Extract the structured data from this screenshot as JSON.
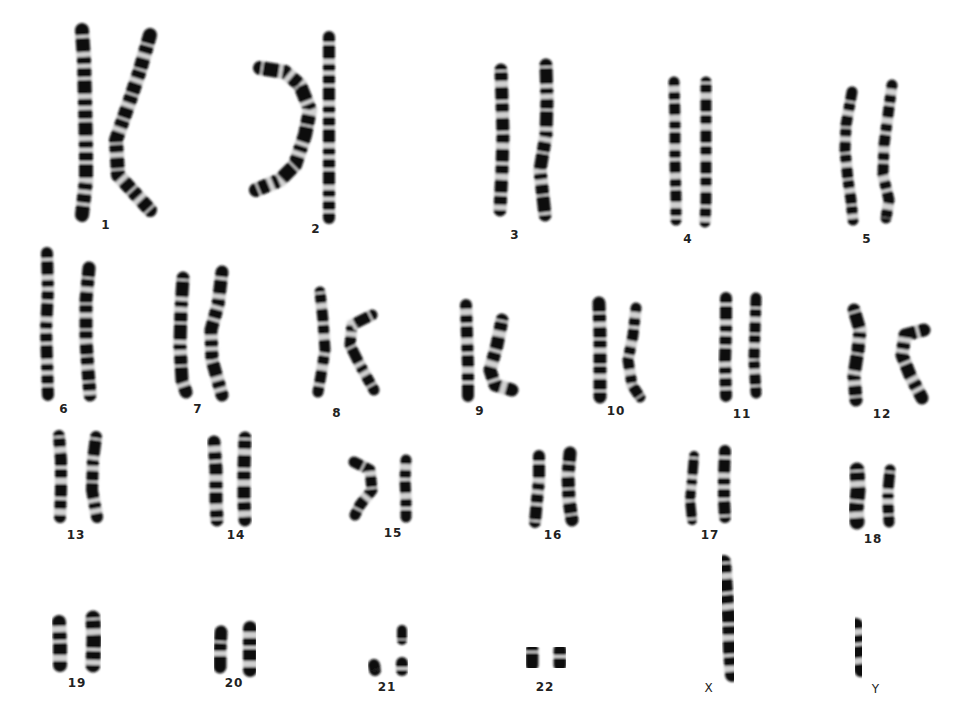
{
  "background": "#ffffff",
  "ink": "#111111",
  "groups": [
    {
      "label": "1",
      "x": 106,
      "ly": 228,
      "chroms": [
        {
          "pts": [
            [
              82,
              30
            ],
            [
              84,
              60
            ],
            [
              85,
              100
            ],
            [
              86,
              150
            ],
            [
              86,
              180
            ],
            [
              82,
              215
            ]
          ],
          "w": 14
        },
        {
          "pts": [
            [
              150,
              35
            ],
            [
              140,
              70
            ],
            [
              130,
              100
            ],
            [
              116,
              140
            ],
            [
              118,
              175
            ],
            [
              150,
              210
            ]
          ],
          "w": 14
        }
      ]
    },
    {
      "label": "2",
      "x": 316,
      "ly": 232,
      "chroms": [
        {
          "pts": [
            [
              260,
              68
            ],
            [
              285,
              72
            ],
            [
              300,
              85
            ],
            [
              310,
              110
            ],
            [
              305,
              135
            ],
            [
              295,
              165
            ],
            [
              280,
              180
            ],
            [
              256,
              190
            ]
          ],
          "w": 14
        },
        {
          "pts": [
            [
              329,
              37
            ],
            [
              329,
              70
            ],
            [
              329,
              100
            ],
            [
              329,
              130
            ],
            [
              329,
              160
            ],
            [
              329,
              190
            ],
            [
              329,
              218
            ]
          ],
          "w": 12
        }
      ]
    },
    {
      "label": "3",
      "x": 515,
      "ly": 238,
      "chroms": [
        {
          "pts": [
            [
              501,
              70
            ],
            [
              502,
              100
            ],
            [
              503,
              135
            ],
            [
              502,
              170
            ],
            [
              500,
              210
            ]
          ],
          "w": 13
        },
        {
          "pts": [
            [
              546,
              65
            ],
            [
              547,
              100
            ],
            [
              546,
              135
            ],
            [
              540,
              170
            ],
            [
              545,
              215
            ]
          ],
          "w": 13
        }
      ]
    },
    {
      "label": "4",
      "x": 688,
      "ly": 242,
      "chroms": [
        {
          "pts": [
            [
              674,
              82
            ],
            [
              675,
              120
            ],
            [
              675,
              160
            ],
            [
              676,
              200
            ],
            [
              676,
              220
            ]
          ],
          "w": 11
        },
        {
          "pts": [
            [
              706,
              82
            ],
            [
              706,
              120
            ],
            [
              706,
              160
            ],
            [
              706,
              200
            ],
            [
              705,
              222
            ]
          ],
          "w": 11
        }
      ]
    },
    {
      "label": "5",
      "x": 867,
      "ly": 242,
      "chroms": [
        {
          "pts": [
            [
              852,
              92
            ],
            [
              846,
              125
            ],
            [
              845,
              150
            ],
            [
              848,
              180
            ],
            [
              851,
              200
            ],
            [
              853,
              220
            ]
          ],
          "w": 11
        },
        {
          "pts": [
            [
              892,
              85
            ],
            [
              888,
              115
            ],
            [
              884,
              145
            ],
            [
              883,
              175
            ],
            [
              889,
              200
            ],
            [
              886,
              218
            ]
          ],
          "w": 11
        }
      ]
    },
    {
      "label": "6",
      "x": 64,
      "ly": 412,
      "chroms": [
        {
          "pts": [
            [
              47,
              253
            ],
            [
              48,
              290
            ],
            [
              46,
              330
            ],
            [
              47,
              360
            ],
            [
              48,
              395
            ]
          ],
          "w": 12
        },
        {
          "pts": [
            [
              89,
              268
            ],
            [
              86,
              300
            ],
            [
              86,
              340
            ],
            [
              88,
              370
            ],
            [
              90,
              395
            ]
          ],
          "w": 13
        }
      ]
    },
    {
      "label": "7",
      "x": 198,
      "ly": 412,
      "chroms": [
        {
          "pts": [
            [
              183,
              278
            ],
            [
              181,
              310
            ],
            [
              180,
              345
            ],
            [
              182,
              380
            ],
            [
              186,
              392
            ]
          ],
          "w": 13
        },
        {
          "pts": [
            [
              222,
              272
            ],
            [
              218,
              305
            ],
            [
              211,
              330
            ],
            [
              212,
              360
            ],
            [
              222,
              395
            ]
          ],
          "w": 13
        }
      ]
    },
    {
      "label": "8",
      "x": 337,
      "ly": 416,
      "chroms": [
        {
          "pts": [
            [
              320,
              292
            ],
            [
              323,
              320
            ],
            [
              325,
              350
            ],
            [
              321,
              375
            ],
            [
              318,
              392
            ]
          ],
          "w": 11
        },
        {
          "pts": [
            [
              372,
              315
            ],
            [
              352,
              325
            ],
            [
              350,
              345
            ],
            [
              360,
              365
            ],
            [
              374,
              390
            ]
          ],
          "w": 11
        }
      ]
    },
    {
      "label": "9",
      "x": 480,
      "ly": 414,
      "chroms": [
        {
          "pts": [
            [
              466,
              305
            ],
            [
              467,
              335
            ],
            [
              468,
              365
            ],
            [
              468,
              396
            ]
          ],
          "w": 12
        },
        {
          "pts": [
            [
              502,
              320
            ],
            [
              497,
              345
            ],
            [
              490,
              370
            ],
            [
              495,
              385
            ],
            [
              512,
              390
            ]
          ],
          "w": 13
        }
      ]
    },
    {
      "label": "10",
      "x": 616,
      "ly": 414,
      "chroms": [
        {
          "pts": [
            [
              599,
              303
            ],
            [
              600,
              335
            ],
            [
              600,
              365
            ],
            [
              600,
              397
            ]
          ],
          "w": 13
        },
        {
          "pts": [
            [
              636,
              308
            ],
            [
              633,
              335
            ],
            [
              628,
              360
            ],
            [
              632,
              385
            ],
            [
              640,
              397
            ]
          ],
          "w": 11
        }
      ]
    },
    {
      "label": "11",
      "x": 742,
      "ly": 417,
      "chroms": [
        {
          "pts": [
            [
              726,
              298
            ],
            [
              726,
              330
            ],
            [
              725,
              360
            ],
            [
              726,
              396
            ]
          ],
          "w": 12
        },
        {
          "pts": [
            [
              756,
              298
            ],
            [
              755,
              330
            ],
            [
              754,
              360
            ],
            [
              756,
              393
            ]
          ],
          "w": 11
        }
      ]
    },
    {
      "label": "12",
      "x": 882,
      "ly": 417,
      "chroms": [
        {
          "pts": [
            [
              854,
              310
            ],
            [
              860,
              330
            ],
            [
              858,
              350
            ],
            [
              854,
              375
            ],
            [
              856,
              400
            ]
          ],
          "w": 13
        },
        {
          "pts": [
            [
              924,
              330
            ],
            [
              905,
              335
            ],
            [
              902,
              355
            ],
            [
              910,
              375
            ],
            [
              922,
              398
            ]
          ],
          "w": 13
        }
      ]
    },
    {
      "label": "13",
      "x": 76,
      "ly": 538,
      "chroms": [
        {
          "pts": [
            [
              59,
              436
            ],
            [
              61,
              460
            ],
            [
              61,
              490
            ],
            [
              60,
              517
            ]
          ],
          "w": 12
        },
        {
          "pts": [
            [
              96,
              437
            ],
            [
              93,
              460
            ],
            [
              92,
              490
            ],
            [
              97,
              517
            ]
          ],
          "w": 12
        }
      ]
    },
    {
      "label": "14",
      "x": 236,
      "ly": 538,
      "chroms": [
        {
          "pts": [
            [
              214,
              442
            ],
            [
              216,
              470
            ],
            [
              216,
              500
            ],
            [
              217,
              520
            ]
          ],
          "w": 13
        },
        {
          "pts": [
            [
              245,
              438
            ],
            [
              244,
              470
            ],
            [
              244,
              500
            ],
            [
              245,
              520
            ]
          ],
          "w": 13
        }
      ]
    },
    {
      "label": "15",
      "x": 393,
      "ly": 536,
      "chroms": [
        {
          "pts": [
            [
              354,
              462
            ],
            [
              370,
              470
            ],
            [
              372,
              490
            ],
            [
              360,
              505
            ],
            [
              355,
              515
            ]
          ],
          "w": 11
        },
        {
          "pts": [
            [
              406,
              460
            ],
            [
              405,
              480
            ],
            [
              406,
              500
            ],
            [
              406,
              517
            ]
          ],
          "w": 11
        }
      ]
    },
    {
      "label": "16",
      "x": 553,
      "ly": 538,
      "chroms": [
        {
          "pts": [
            [
              539,
              456
            ],
            [
              539,
              480
            ],
            [
              537,
              500
            ],
            [
              535,
              522
            ]
          ],
          "w": 12
        },
        {
          "pts": [
            [
              570,
              453
            ],
            [
              568,
              475
            ],
            [
              569,
              500
            ],
            [
              572,
              520
            ]
          ],
          "w": 13
        }
      ]
    },
    {
      "label": "17",
      "x": 710,
      "ly": 538,
      "chroms": [
        {
          "pts": [
            [
              694,
              456
            ],
            [
              692,
              480
            ],
            [
              690,
              500
            ],
            [
              692,
              520
            ]
          ],
          "w": 10
        },
        {
          "pts": [
            [
              725,
              451
            ],
            [
              724,
              475
            ],
            [
              724,
              500
            ],
            [
              725,
              517
            ]
          ],
          "w": 12
        }
      ]
    },
    {
      "label": "18",
      "x": 873,
      "ly": 542,
      "chroms": [
        {
          "pts": [
            [
              857,
              470
            ],
            [
              858,
              490
            ],
            [
              856,
              510
            ],
            [
              857,
              522
            ]
          ],
          "w": 15
        },
        {
          "pts": [
            [
              890,
              470
            ],
            [
              888,
              490
            ],
            [
              888,
              505
            ],
            [
              889,
              522
            ]
          ],
          "w": 11
        }
      ]
    },
    {
      "label": "19",
      "x": 77,
      "ly": 686,
      "chroms": [
        {
          "pts": [
            [
              59,
              622
            ],
            [
              60,
              645
            ],
            [
              60,
              665
            ]
          ],
          "w": 14
        },
        {
          "pts": [
            [
              93,
              618
            ],
            [
              94,
              640
            ],
            [
              93,
              665
            ]
          ],
          "w": 15
        }
      ]
    },
    {
      "label": "20",
      "x": 234,
      "ly": 686,
      "chroms": [
        {
          "pts": [
            [
              221,
              632
            ],
            [
              220,
              650
            ],
            [
              220,
              667
            ]
          ],
          "w": 13
        },
        {
          "pts": [
            [
              250,
              628
            ],
            [
              250,
              650
            ],
            [
              250,
              670
            ]
          ],
          "w": 14
        }
      ]
    },
    {
      "label": "21",
      "x": 387,
      "ly": 690,
      "chroms": [
        {
          "pts": [
            [
              374,
              665
            ],
            [
              375,
              670
            ]
          ],
          "w": 12
        },
        {
          "pts": [
            [
              402,
              630
            ],
            [
              402,
              640
            ]
          ],
          "w": 10
        },
        {
          "pts": [
            [
              402,
              663
            ],
            [
              402,
              670
            ]
          ],
          "w": 12
        }
      ]
    },
    {
      "label": "22",
      "x": 545,
      "ly": 690,
      "chroms": [
        {
          "pts": [
            [
              532,
              650
            ],
            [
              532,
              665
            ]
          ],
          "w": 13
        },
        {
          "pts": [
            [
              560,
              650
            ],
            [
              560,
              665
            ]
          ],
          "w": 13
        }
      ]
    },
    {
      "label": "X",
      "x": 709,
      "ly": 691,
      "sex": true,
      "chroms": [
        {
          "pts": [
            [
              724,
              562
            ],
            [
              726,
              590
            ],
            [
              729,
              620
            ],
            [
              730,
              650
            ],
            [
              732,
              675
            ]
          ],
          "w": 14
        }
      ]
    },
    {
      "label": "Y",
      "x": 876,
      "ly": 692,
      "sex": true,
      "chroms": [
        {
          "pts": [
            [
              856,
              625
            ],
            [
              858,
              645
            ],
            [
              861,
              670
            ]
          ],
          "w": 14
        }
      ]
    }
  ]
}
